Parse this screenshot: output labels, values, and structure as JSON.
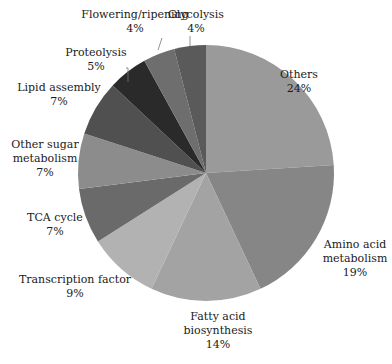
{
  "chart_data": {
    "type": "pie",
    "title": "",
    "start_angle_deg": 0,
    "direction": "clockwise",
    "center": [
      206,
      173
    ],
    "radius": 128,
    "slices": [
      {
        "label": "Others",
        "value": 24,
        "pct_text": "24%",
        "color": "#9a9a9a",
        "label_lines": [
          "Others"
        ],
        "label_pos": [
          299,
          78
        ],
        "leader": null
      },
      {
        "label": "Amino acid metabolism",
        "value": 19,
        "pct_text": "19%",
        "color": "#868686",
        "label_lines": [
          "Amino acid",
          "metabolism"
        ],
        "label_pos": [
          355,
          248
        ],
        "leader": null
      },
      {
        "label": "Fatty acid biosynthesis",
        "value": 14,
        "pct_text": "14%",
        "color": "#a3a3a3",
        "label_lines": [
          "Fatty acid",
          "biosynthesis"
        ],
        "label_pos": [
          218,
          320
        ],
        "leader": null
      },
      {
        "label": "Transcription factor",
        "value": 9,
        "pct_text": "9%",
        "color": "#b2b2b2",
        "label_lines": [
          "Transcription factor"
        ],
        "label_pos": [
          75,
          283
        ],
        "leader": null
      },
      {
        "label": "TCA cycle",
        "value": 7,
        "pct_text": "7%",
        "color": "#6a6a6a",
        "label_lines": [
          "TCA cycle"
        ],
        "label_pos": [
          55,
          221
        ],
        "leader": null
      },
      {
        "label": "Other sugar metabolism",
        "value": 7,
        "pct_text": "7%",
        "color": "#8c8c8c",
        "label_lines": [
          "Other sugar",
          "metabolism"
        ],
        "label_pos": [
          45,
          148
        ],
        "leader": null
      },
      {
        "label": "Lipid assembly",
        "value": 7,
        "pct_text": "7%",
        "color": "#505050",
        "label_lines": [
          "Lipid assembly"
        ],
        "label_pos": [
          59,
          91
        ],
        "leader": null
      },
      {
        "label": "Proteolysis",
        "value": 5,
        "pct_text": "5%",
        "color": "#2a2a2a",
        "label_lines": [
          "Proteolysis"
        ],
        "label_pos": [
          96,
          56
        ],
        "leader": [
          [
            126,
            68
          ],
          [
            128,
            68
          ],
          [
            128,
            82
          ]
        ]
      },
      {
        "label": "Flowering/ripening",
        "value": 4,
        "pct_text": "4%",
        "color": "#6e6e6e",
        "label_lines": [
          "Flowering/ripening"
        ],
        "label_pos": [
          135,
          18
        ],
        "leader": [
          [
            162,
            38
          ],
          [
            158,
            50
          ]
        ]
      },
      {
        "label": "Glycolysis",
        "value": 4,
        "pct_text": "4%",
        "color": "#5a5a5a",
        "label_lines": [
          "Glycolysis"
        ],
        "label_pos": [
          196,
          18
        ],
        "leader": [
          [
            190,
            36
          ],
          [
            190,
            46
          ]
        ]
      }
    ],
    "legend": "none (direct labels)",
    "grid": false
  }
}
